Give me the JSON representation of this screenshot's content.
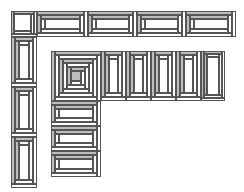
{
  "colors": {
    "background": "#ffffff",
    "stroke": "#555555",
    "dark_fill": "#bdbdbd",
    "light_fill": "#ffffff"
  },
  "diagram": {
    "outer_corner": {
      "x": 11,
      "y": 11,
      "w": 26,
      "h": 26,
      "type": "log-cabin-square"
    },
    "outer_top_row": [
      {
        "x": 37,
        "y": 11,
        "w": 51,
        "h": 26,
        "type": "log-cabin-horizontal"
      },
      {
        "x": 88,
        "y": 11,
        "w": 49,
        "h": 26,
        "type": "log-cabin-horizontal"
      },
      {
        "x": 137,
        "y": 11,
        "w": 49,
        "h": 26,
        "type": "log-cabin-horizontal"
      },
      {
        "x": 186,
        "y": 11,
        "w": 50,
        "h": 26,
        "type": "log-cabin-horizontal"
      }
    ],
    "outer_left_column": [
      {
        "x": 11,
        "y": 37,
        "w": 26,
        "h": 50,
        "type": "log-cabin-vertical"
      },
      {
        "x": 11,
        "y": 87,
        "w": 26,
        "h": 50,
        "type": "log-cabin-vertical"
      },
      {
        "x": 11,
        "y": 137,
        "w": 26,
        "h": 51,
        "type": "log-cabin-vertical"
      }
    ],
    "inner_corner": {
      "x": 51,
      "y": 51,
      "w": 50,
      "h": 50,
      "type": "log-cabin-concentric"
    },
    "inner_top_row": [
      {
        "x": 101,
        "y": 51,
        "w": 25,
        "h": 50,
        "type": "log-cabin-vertical"
      },
      {
        "x": 126,
        "y": 51,
        "w": 25,
        "h": 50,
        "type": "log-cabin-vertical"
      },
      {
        "x": 151,
        "y": 51,
        "w": 25,
        "h": 50,
        "type": "log-cabin-vertical"
      },
      {
        "x": 176,
        "y": 51,
        "w": 25,
        "h": 50,
        "type": "log-cabin-vertical"
      },
      {
        "x": 201,
        "y": 51,
        "w": 24,
        "h": 50,
        "type": "log-cabin-vertical"
      }
    ],
    "inner_left_column": [
      {
        "x": 51,
        "y": 101,
        "w": 50,
        "h": 25,
        "type": "log-cabin-horizontal"
      },
      {
        "x": 51,
        "y": 126,
        "w": 50,
        "h": 25,
        "type": "log-cabin-horizontal"
      },
      {
        "x": 51,
        "y": 151,
        "w": 50,
        "h": 26,
        "type": "log-cabin-horizontal"
      }
    ]
  }
}
